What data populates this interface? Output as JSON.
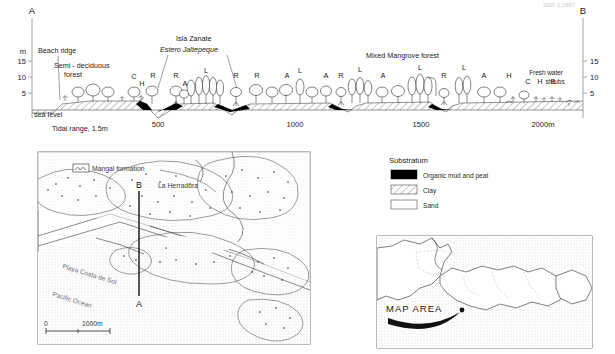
{
  "figure": {
    "corner_note": "SEP 2 1997",
    "profile": {
      "left_endpoint": "A",
      "right_endpoint": "B",
      "y_unit": "m",
      "y_ticks": [
        "15",
        "10",
        "5"
      ],
      "y_ticks_right": [
        "15",
        "10",
        "5"
      ],
      "sea_level_label": "sea level",
      "tidal_range": "Tidal range, 1.5m",
      "x_ticks": [
        "500",
        "1000",
        "1500",
        "2000m"
      ],
      "zone_labels": [
        "Beach ridge",
        "Semi - deciduous",
        "forest",
        "Isla Zanate",
        "Mixed  Mangrove  forest",
        "Fresh water",
        "shrubs"
      ],
      "italic_label": "Estero  Jaltepeque",
      "species_codes": [
        "C",
        "H",
        "R",
        "R",
        "L",
        "A",
        "R",
        "R",
        "A",
        "L",
        "A",
        "R",
        "L",
        "A",
        "L",
        "R",
        "L",
        "A",
        "H",
        "C",
        "H",
        "B"
      ]
    },
    "map": {
      "transect_top": "B",
      "transect_bottom": "A",
      "legend_key": "Mangal formation",
      "place_town": "La Herradura",
      "place_beach": "Playa Costa de Sol",
      "place_ocean": "Pacific Ocean",
      "scale_zero": "0",
      "scale_max": "1000m"
    },
    "legend": {
      "title": "Substratum",
      "items": [
        {
          "label": "Organic mud and peat",
          "swatch": "solid-black"
        },
        {
          "label": "Clay",
          "swatch": "hatched"
        },
        {
          "label": "Sand",
          "swatch": "white"
        }
      ]
    },
    "inset": {
      "label": "MAP AREA"
    }
  }
}
